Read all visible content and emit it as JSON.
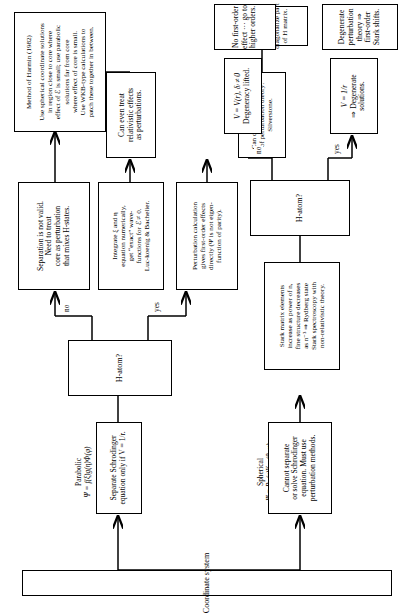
{
  "figure": {
    "orientation": "rotated-90-ccw"
  },
  "root": {
    "label": "Coordinate system"
  },
  "branches": {
    "spherical": {
      "name": "Spherical",
      "formula": "Ψ = Rₙₗ(r)Yₗₘₗ(θ, φ)"
    },
    "parabolic": {
      "name": "Parabolic",
      "formula": "Ψ = f(ξ)g(η)Φ(φ)"
    }
  },
  "edge_labels": {
    "yes": "yes",
    "no": "no"
  },
  "nodes": {
    "cannot_separate": {
      "lines": [
        "Cannot separate",
        "or solve Schrodinger",
        "equation. Must use",
        "perturbation methods."
      ]
    },
    "separate_schrodinger": {
      "lines": [
        "Separate Schrodinger",
        "equation only if V = 1/r."
      ]
    },
    "h_atom_upper": {
      "lines": [
        "H-atom?"
      ]
    },
    "h_atom_lower": {
      "lines": [
        "H-atom?"
      ]
    },
    "separation_not_valid": {
      "lines": [
        "Separation is not valid.",
        "Need to treat",
        "core as perturbation",
        "that mixes H-states."
      ]
    },
    "integrate_xi_eta": {
      "lines": [
        "Integrate ξ and η",
        "equation numerically,",
        "get “exact” wave-",
        "functions for ℰ ≠ 0.",
        "Luc-koenig & Bachelier."
      ]
    },
    "perturbation_calculation": {
      "lines": [
        "Perturbation calculation",
        "gives first-order effects",
        "directly (Ψ is not eigen-",
        "function of parity)."
      ]
    },
    "can_even_treat": {
      "lines": [
        "Can even treat",
        "relativistic effects",
        "as perturbations."
      ]
    },
    "very_high_orders": {
      "lines": [
        "Can do very high orders",
        "of perturbation theory:",
        "Silverstone."
      ]
    },
    "method_of_harmin": {
      "lines": [
        "Method of Harmin (1982)",
        "",
        "Use spherical coordinate solutions",
        "in region close to core where",
        "effect of ℰ is small; use parabolic",
        "solutions far from core",
        "where effect of core is small.",
        "Use WKB-type calculations to",
        "patch these together in between."
      ]
    },
    "zimmerman": {
      "lines": [
        "Zimmerman et al. (1979).",
        "",
        "Calculate and",
        "diagonalize part",
        "of H matrix."
      ]
    },
    "stark_matrix_elements": {
      "lines": [
        "Stark matrix elements",
        "increase as power of n,",
        "fine structure decreases",
        "as n⁻³ ⇒ Rydberg state",
        "Stark spectroscopy with",
        "non-relativistic theory."
      ]
    },
    "v_one_over_r": {
      "lines": [
        "V = 1/r",
        "⇒ Degenerate",
        "solutions."
      ]
    },
    "v_of_r": {
      "lines": [
        "V = V(r), δₗ ≠ 0",
        "Degeneracy lifted."
      ]
    },
    "degenerate_perturbation": {
      "lines": [
        "Degenerate",
        "perturbation",
        "theory ⇒",
        "first-order",
        "Stark shifts."
      ]
    },
    "no_first_order": {
      "lines": [
        "No first-order",
        "effect ··· go to",
        "higher orders."
      ]
    }
  }
}
